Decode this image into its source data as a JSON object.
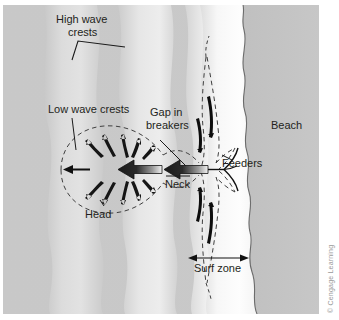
{
  "figure": {
    "credit": "© Cengage Learning",
    "background": "#ffffff",
    "labels": {
      "high_wave_crests_line1": "High wave",
      "high_wave_crests_line2": "crests",
      "low_wave_crests": "Low wave crests",
      "gap_in_breakers_line1": "Gap in",
      "gap_in_breakers_line2": "breakers",
      "beach": "Beach",
      "feeders": "Feeders",
      "neck": "Neck",
      "head": "Head",
      "surf_zone": "Surf zone"
    },
    "colors": {
      "open_water": "#c6c6c6",
      "wave_band_light": "#dedede",
      "wave_band_mid": "#d2d2d2",
      "surf_zone": "#fbfbfb",
      "beach": "#c3c3c3",
      "ink": "#231f20",
      "dashed_line": "#4d4d4d",
      "credit_text": "#9a9a9a"
    },
    "regions": [
      {
        "name": "open-water",
        "label": null
      },
      {
        "name": "wave-crest-band-1",
        "label": "high wave crest"
      },
      {
        "name": "wave-crest-band-2",
        "label": "high wave crest"
      },
      {
        "name": "surf-zone-band",
        "label": "surf zone"
      },
      {
        "name": "beach-region",
        "label": "Beach"
      }
    ],
    "features": [
      {
        "name": "head",
        "label": "Head",
        "desc": "circular dashed expansion of rip current offshore"
      },
      {
        "name": "neck",
        "label": "Neck",
        "desc": "narrow fast seaward channel through the breakers"
      },
      {
        "name": "feeders",
        "label": "Feeders",
        "desc": "longshore currents feeding the rip"
      },
      {
        "name": "gap-in-breakers",
        "label": "Gap in breakers",
        "desc": "break in the wave crest line"
      },
      {
        "name": "surf-zone",
        "label": "Surf zone",
        "desc": "measured band between breakers and shoreline"
      }
    ]
  }
}
